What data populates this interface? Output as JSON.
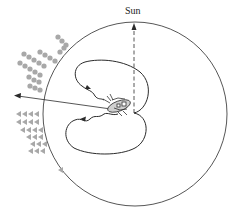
{
  "diagram": {
    "sun_label": "Sun",
    "colors": {
      "line": "#2b2b2b",
      "markers": "#a8a8a8",
      "bee": "#333333"
    },
    "elements": {
      "outer_circle": "hive comb boundary",
      "sun_direction": "dashed vertical arrow pointing up to Sun",
      "food_direction": "solid arrow pointing left past circle",
      "dance_path": "figure-eight waggle dance loops",
      "dancer": "bee in center",
      "followers": "dotted and arrow markers at left edge"
    }
  }
}
